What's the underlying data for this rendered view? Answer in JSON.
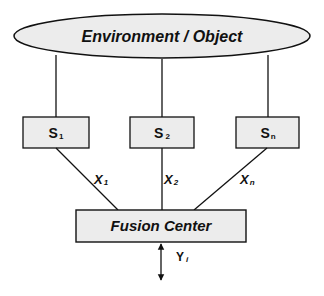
{
  "diagram": {
    "environment": {
      "label": "Environment / Object"
    },
    "sensors": [
      {
        "base": "S",
        "sub": "1"
      },
      {
        "base": "S",
        "sub": "2"
      },
      {
        "base": "S",
        "sub": "n"
      }
    ],
    "signals": [
      {
        "base": "X",
        "sub": "1"
      },
      {
        "base": "X",
        "sub": "2"
      },
      {
        "base": "X",
        "sub": "n"
      }
    ],
    "fusion": {
      "label": "Fusion Center"
    },
    "output": {
      "base": "Y",
      "sub": "i"
    },
    "colors": {
      "fill": "#ececec",
      "stroke": "#111111"
    }
  }
}
